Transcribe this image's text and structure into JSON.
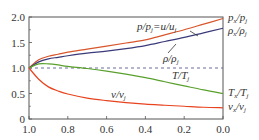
{
  "chart_data": {
    "type": "line",
    "title": "",
    "xlabel": "",
    "ylabel": "",
    "xlim": [
      1.0,
      0.0
    ],
    "ylim": [
      0,
      2.0
    ],
    "grid": false,
    "x_ticks": [
      "1.0",
      "0.8",
      "0.6",
      "0.4",
      "0.2",
      "0.0"
    ],
    "y_ticks": [
      "0",
      "0.5",
      "1.0",
      "1.5",
      "2.0"
    ],
    "reference_line": {
      "y": 1.0,
      "style": "dashed",
      "color": "#6a6a9a"
    },
    "x": [
      1.0,
      0.95,
      0.9,
      0.85,
      0.8,
      0.7,
      0.6,
      0.5,
      0.4,
      0.3,
      0.2,
      0.1,
      0.0
    ],
    "series": [
      {
        "name": "p/p_j = u/u_j",
        "color": "#d9552b",
        "values": [
          1.0,
          1.16,
          1.23,
          1.27,
          1.31,
          1.37,
          1.43,
          1.49,
          1.55,
          1.65,
          1.75,
          1.86,
          1.97
        ],
        "end_label": "p_x/p_j"
      },
      {
        "name": "ρ/ρ_j",
        "color": "#3a3a7a",
        "values": [
          1.0,
          1.12,
          1.18,
          1.21,
          1.24,
          1.29,
          1.33,
          1.38,
          1.44,
          1.52,
          1.6,
          1.69,
          1.78
        ],
        "end_label": "ρ_x/ρ_j"
      },
      {
        "name": "T/T_j",
        "color": "#5aa02c",
        "values": [
          1.0,
          1.08,
          1.08,
          1.06,
          1.03,
          0.99,
          0.94,
          0.88,
          0.81,
          0.73,
          0.65,
          0.57,
          0.5
        ],
        "end_label": "T_x/T_j"
      },
      {
        "name": "v/v_j",
        "color": "#e8431f",
        "values": [
          1.0,
          0.78,
          0.63,
          0.55,
          0.49,
          0.41,
          0.36,
          0.32,
          0.29,
          0.27,
          0.25,
          0.23,
          0.22
        ],
        "end_label": "v_x/v_j"
      }
    ],
    "annotations": [
      {
        "text": "p/p_j = u/u_j",
        "near": "upper orange curve"
      },
      {
        "text": "ρ/ρ_j",
        "near": "blue curve"
      },
      {
        "text": "T/T_j",
        "near": "green curve"
      },
      {
        "text": "v/v_j",
        "near": "red curve"
      }
    ]
  },
  "labels": {
    "y_ticks": [
      "0",
      "0.5",
      "1.0",
      "1.5",
      "2.0"
    ],
    "x_ticks": [
      "1.0",
      "0.8",
      "0.6",
      "0.4",
      "0.2",
      "0.0"
    ],
    "curve_p": {
      "main": "p/p",
      "sub": "j",
      "eq": "=u/u",
      "sub2": "j"
    },
    "curve_rho": {
      "main": "ρ/ρ",
      "sub": "j"
    },
    "curve_T": {
      "main": "T/T",
      "sub": "j"
    },
    "curve_v": {
      "main": "v/v",
      "sub": "j"
    },
    "end_px": {
      "a": "p",
      "as": "x",
      "b": "/p",
      "bs": "j"
    },
    "end_rhox": {
      "a": "ρ",
      "as": "x",
      "b": "/ρ",
      "bs": "j"
    },
    "end_Tx": {
      "a": "T",
      "as": "x",
      "b": "/T",
      "bs": "j"
    },
    "end_vx": {
      "a": "v",
      "as": "x",
      "b": "/v",
      "bs": "j"
    }
  }
}
